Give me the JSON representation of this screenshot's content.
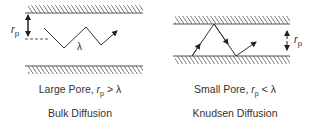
{
  "panels": [
    {
      "id": "large-pore",
      "caption_prefix": "Large Pore, ",
      "caption_var": "r",
      "caption_sub": "p",
      "caption_suffix": " > λ",
      "title": "Bulk Diffusion",
      "radius_label": "r",
      "radius_sub": "p",
      "path_label": "λ"
    },
    {
      "id": "small-pore",
      "caption_prefix": "Small Pore, ",
      "caption_var": "r",
      "caption_sub": "p",
      "caption_suffix": " < λ",
      "title": "Knudsen Diffusion",
      "radius_label": "r",
      "radius_sub": "p"
    }
  ],
  "colors": {
    "line": "#333333",
    "wall": "#555555"
  }
}
